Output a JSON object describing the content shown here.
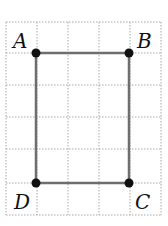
{
  "diagram": {
    "type": "rectangle-on-grid",
    "grid": {
      "color": "#9a9a9a",
      "x_lines": [
        6,
        37,
        68,
        99,
        130,
        161
      ],
      "y_lines": [
        22,
        53,
        85,
        117,
        149,
        183,
        215
      ]
    },
    "shape": {
      "stroke": "#6e6e6e",
      "vertices": [
        {
          "name": "A",
          "x": 36,
          "y": 53,
          "label_x": 12,
          "label_y": 47
        },
        {
          "name": "B",
          "x": 129,
          "y": 53,
          "label_x": 138,
          "label_y": 47
        },
        {
          "name": "C",
          "x": 129,
          "y": 183,
          "label_x": 136,
          "label_y": 210
        },
        {
          "name": "D",
          "x": 36,
          "y": 183,
          "label_x": 14,
          "label_y": 210
        }
      ]
    },
    "labels": {
      "A": "A",
      "B": "B",
      "C": "C",
      "D": "D"
    }
  }
}
